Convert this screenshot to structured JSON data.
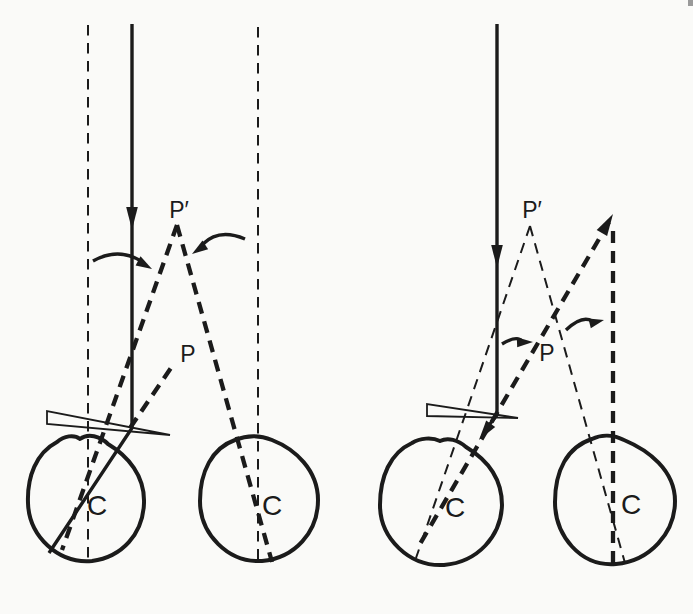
{
  "colors": {
    "ink": "#1b1b1b",
    "paper": "#fafaf8"
  },
  "left_panel": {
    "p_prime_label": "P′",
    "p_label": "P",
    "left_eye": {
      "center_label": "C"
    },
    "right_eye": {
      "center_label": "C"
    }
  },
  "right_panel": {
    "p_prime_label": "P′",
    "p_label": "P",
    "left_eye": {
      "center_label": "C"
    },
    "right_eye": {
      "center_label": "C"
    }
  }
}
